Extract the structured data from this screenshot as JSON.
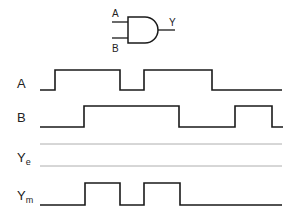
{
  "gate": {
    "type": "AND",
    "input_a_label": "A",
    "input_b_label": "B",
    "output_label": "Y"
  },
  "signals": [
    {
      "name": "A",
      "sub": "",
      "waveform": "0 1 1 0 1 1 0 0",
      "transitions_x": [
        55,
        120,
        144,
        212
      ]
    },
    {
      "name": "B",
      "sub": "",
      "waveform": "0 0 1 1 0 0 1 0",
      "transitions_x": [
        84,
        179,
        235,
        272
      ]
    },
    {
      "name": "Y",
      "sub": "e",
      "waveform": "empty (to be filled)"
    },
    {
      "name": "Y",
      "sub": "m",
      "waveform": "0 1 0 1 0",
      "transitions_x": [
        85,
        120,
        144,
        180
      ]
    }
  ],
  "colors": {
    "line": "#1a1a1a",
    "guide": "#9a9a9a",
    "background": "#ffffff"
  }
}
